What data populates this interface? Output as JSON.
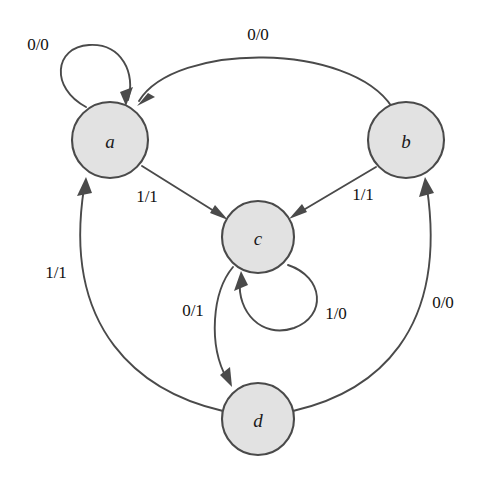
{
  "diagram": {
    "type": "finite-state-machine",
    "label_format": "input/output",
    "canvas": {
      "width": 480,
      "height": 481,
      "background": "#ffffff"
    },
    "style": {
      "node_fill": "#e2e2e2",
      "node_stroke": "#4a4a4a",
      "edge_stroke": "#4a4a4a",
      "text_color": "#111111"
    },
    "states": [
      {
        "id": "a",
        "label": "a",
        "cx": 110,
        "cy": 140,
        "r": 38
      },
      {
        "id": "b",
        "label": "b",
        "cx": 406,
        "cy": 140,
        "r": 38
      },
      {
        "id": "c",
        "label": "c",
        "cx": 258,
        "cy": 237,
        "r": 36
      },
      {
        "id": "d",
        "label": "d",
        "cx": 258,
        "cy": 419,
        "r": 36
      }
    ],
    "transitions": [
      {
        "id": "a-a",
        "from": "a",
        "to": "a",
        "label": "0/0",
        "kind": "self-loop",
        "label_x": 38,
        "label_y": 44
      },
      {
        "id": "b-a",
        "from": "b",
        "to": "a",
        "label": "0/0",
        "kind": "arc",
        "label_x": 258,
        "label_y": 34
      },
      {
        "id": "a-c",
        "from": "a",
        "to": "c",
        "label": "1/1",
        "kind": "straight",
        "label_x": 147,
        "label_y": 196
      },
      {
        "id": "b-c",
        "from": "b",
        "to": "c",
        "label": "1/1",
        "kind": "straight",
        "label_x": 363,
        "label_y": 194
      },
      {
        "id": "c-c",
        "from": "c",
        "to": "c",
        "label": "1/0",
        "kind": "self-loop",
        "label_x": 336,
        "label_y": 313
      },
      {
        "id": "c-d",
        "from": "c",
        "to": "d",
        "label": "0/1",
        "kind": "arc",
        "label_x": 193,
        "label_y": 310
      },
      {
        "id": "d-a",
        "from": "d",
        "to": "a",
        "label": "1/1",
        "kind": "arc",
        "label_x": 56,
        "label_y": 272
      },
      {
        "id": "d-b",
        "from": "d",
        "to": "b",
        "label": "0/0",
        "kind": "arc",
        "label_x": 443,
        "label_y": 302
      }
    ]
  }
}
